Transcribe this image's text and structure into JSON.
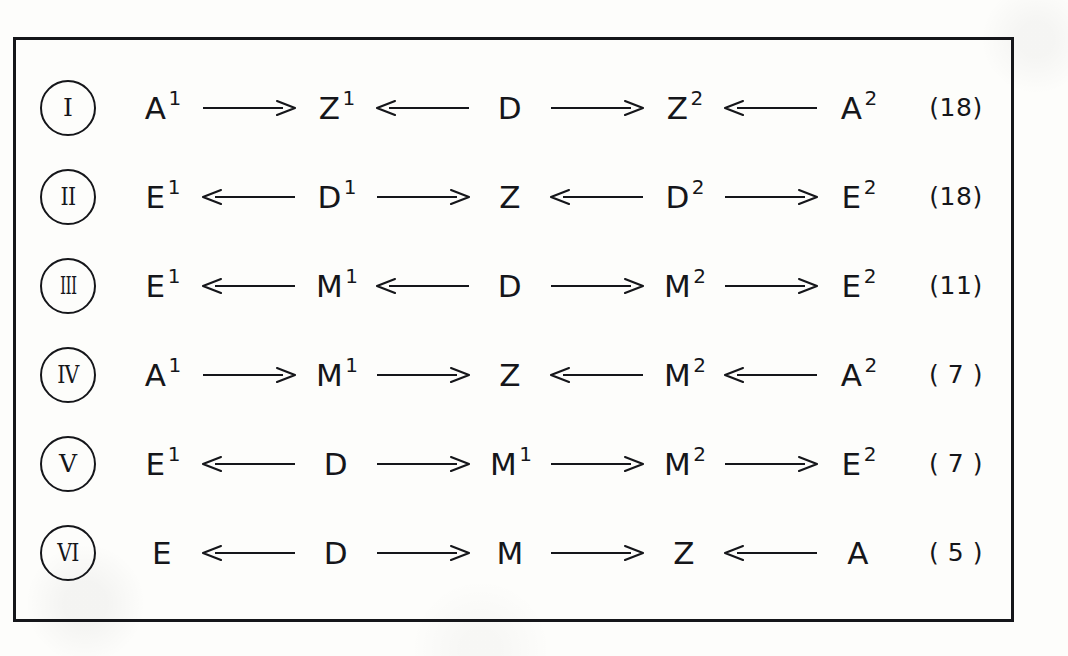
{
  "diagram": {
    "frame_color": "#15161a",
    "background_color": "#fdfdfb",
    "rows": [
      {
        "numeral": "I",
        "count": "(18)",
        "nodes": [
          {
            "base": "A",
            "sup": "1"
          },
          {
            "base": "Z",
            "sup": "1"
          },
          {
            "base": "D",
            "sup": ""
          },
          {
            "base": "Z",
            "sup": "2"
          },
          {
            "base": "A",
            "sup": "2"
          }
        ],
        "arrows": [
          "right",
          "left",
          "right",
          "left"
        ]
      },
      {
        "numeral": "II",
        "count": "(18)",
        "nodes": [
          {
            "base": "E",
            "sup": "1"
          },
          {
            "base": "D",
            "sup": "1"
          },
          {
            "base": "Z",
            "sup": ""
          },
          {
            "base": "D",
            "sup": "2"
          },
          {
            "base": "E",
            "sup": "2"
          }
        ],
        "arrows": [
          "left",
          "right",
          "left",
          "right"
        ]
      },
      {
        "numeral": "III",
        "count": "(11)",
        "nodes": [
          {
            "base": "E",
            "sup": "1"
          },
          {
            "base": "M",
            "sup": "1"
          },
          {
            "base": "D",
            "sup": ""
          },
          {
            "base": "M",
            "sup": "2"
          },
          {
            "base": "E",
            "sup": "2"
          }
        ],
        "arrows": [
          "left",
          "left",
          "right",
          "right"
        ]
      },
      {
        "numeral": "IV",
        "count": "( 7 )",
        "nodes": [
          {
            "base": "A",
            "sup": "1"
          },
          {
            "base": "M",
            "sup": "1"
          },
          {
            "base": "Z",
            "sup": ""
          },
          {
            "base": "M",
            "sup": "2"
          },
          {
            "base": "A",
            "sup": "2"
          }
        ],
        "arrows": [
          "right",
          "right",
          "left",
          "left"
        ]
      },
      {
        "numeral": "V",
        "count": "( 7 )",
        "nodes": [
          {
            "base": "E",
            "sup": "1"
          },
          {
            "base": "D",
            "sup": ""
          },
          {
            "base": "M",
            "sup": "1"
          },
          {
            "base": "M",
            "sup": "2"
          },
          {
            "base": "E",
            "sup": "2"
          }
        ],
        "arrows": [
          "left",
          "right",
          "right",
          "right"
        ]
      },
      {
        "numeral": "VI",
        "count": "( 5 )",
        "nodes": [
          {
            "base": "E",
            "sup": ""
          },
          {
            "base": "D",
            "sup": ""
          },
          {
            "base": "M",
            "sup": ""
          },
          {
            "base": "Z",
            "sup": ""
          },
          {
            "base": "A",
            "sup": ""
          }
        ],
        "arrows": [
          "left",
          "right",
          "right",
          "left"
        ]
      }
    ]
  }
}
